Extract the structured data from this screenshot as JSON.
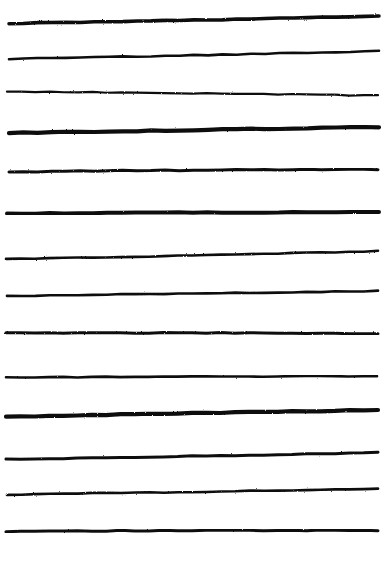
{
  "document": {
    "title": "Hand-drawn horizontal lines",
    "kind": "scanned-ink-drawing",
    "width": 385,
    "height": 562,
    "background_color": "#ffffff",
    "ink_color": "#111111",
    "description": "Fourteen roughly parallel hand-drawn horizontal black ink strokes spanning nearly the full width of a white page"
  },
  "palette": {
    "paper": "#ffffff",
    "ink": "#111111",
    "ink_light": "#2a2a2a"
  },
  "strokes": {
    "count": 14,
    "items": [
      {
        "index": 1,
        "label": "stroke-1",
        "x_start": 9,
        "x_end": 379,
        "y_start": 23.5,
        "y_mid": 20.5,
        "y_end": 16.0,
        "thickness": 3.6,
        "slope": "rising-right"
      },
      {
        "index": 2,
        "label": "stroke-2",
        "x_start": 9,
        "x_end": 379,
        "y_start": 59.0,
        "y_mid": 55.5,
        "y_end": 51.0,
        "thickness": 2.6,
        "slope": "rising-right"
      },
      {
        "index": 3,
        "label": "stroke-3",
        "x_start": 7,
        "x_end": 378,
        "y_start": 91.5,
        "y_mid": 93.0,
        "y_end": 95.5,
        "thickness": 2.2,
        "slope": "falling-right"
      },
      {
        "index": 4,
        "label": "stroke-4",
        "x_start": 9,
        "x_end": 379,
        "y_start": 133.0,
        "y_mid": 130.0,
        "y_end": 127.0,
        "thickness": 4.2,
        "slope": "rising-right"
      },
      {
        "index": 5,
        "label": "stroke-5",
        "x_start": 9,
        "x_end": 378,
        "y_start": 172.0,
        "y_mid": 169.5,
        "y_end": 169.5,
        "thickness": 3.0,
        "slope": "slightly-rising"
      },
      {
        "index": 6,
        "label": "stroke-6",
        "x_start": 7,
        "x_end": 379,
        "y_start": 213.5,
        "y_mid": 212.5,
        "y_end": 212.0,
        "thickness": 4.0,
        "slope": "flat"
      },
      {
        "index": 7,
        "label": "stroke-7",
        "x_start": 6,
        "x_end": 378,
        "y_start": 259.0,
        "y_mid": 256.0,
        "y_end": 251.0,
        "thickness": 2.6,
        "slope": "rising-right"
      },
      {
        "index": 8,
        "label": "stroke-8",
        "x_start": 7,
        "x_end": 378,
        "y_start": 296.0,
        "y_mid": 293.5,
        "y_end": 291.0,
        "thickness": 2.6,
        "slope": "rising-right"
      },
      {
        "index": 9,
        "label": "stroke-9",
        "x_start": 6,
        "x_end": 378,
        "y_start": 333.0,
        "y_mid": 332.5,
        "y_end": 333.5,
        "thickness": 3.0,
        "slope": "flat"
      },
      {
        "index": 10,
        "label": "stroke-10",
        "x_start": 6,
        "x_end": 377,
        "y_start": 377.5,
        "y_mid": 376.5,
        "y_end": 376.0,
        "thickness": 2.6,
        "slope": "flat"
      },
      {
        "index": 11,
        "label": "stroke-11",
        "x_start": 6,
        "x_end": 378,
        "y_start": 417.0,
        "y_mid": 413.0,
        "y_end": 410.0,
        "thickness": 4.2,
        "slope": "rising-right"
      },
      {
        "index": 12,
        "label": "stroke-12",
        "x_start": 6,
        "x_end": 378,
        "y_start": 459.5,
        "y_mid": 456.5,
        "y_end": 452.5,
        "thickness": 3.0,
        "slope": "rising-right"
      },
      {
        "index": 13,
        "label": "stroke-13",
        "x_start": 7,
        "x_end": 378,
        "y_start": 494.5,
        "y_mid": 492.0,
        "y_end": 489.0,
        "thickness": 2.6,
        "slope": "rising-right"
      },
      {
        "index": 14,
        "label": "stroke-14",
        "x_start": 6,
        "x_end": 378,
        "y_start": 531.5,
        "y_mid": 530.0,
        "y_end": 530.5,
        "thickness": 3.0,
        "slope": "flat"
      }
    ]
  }
}
